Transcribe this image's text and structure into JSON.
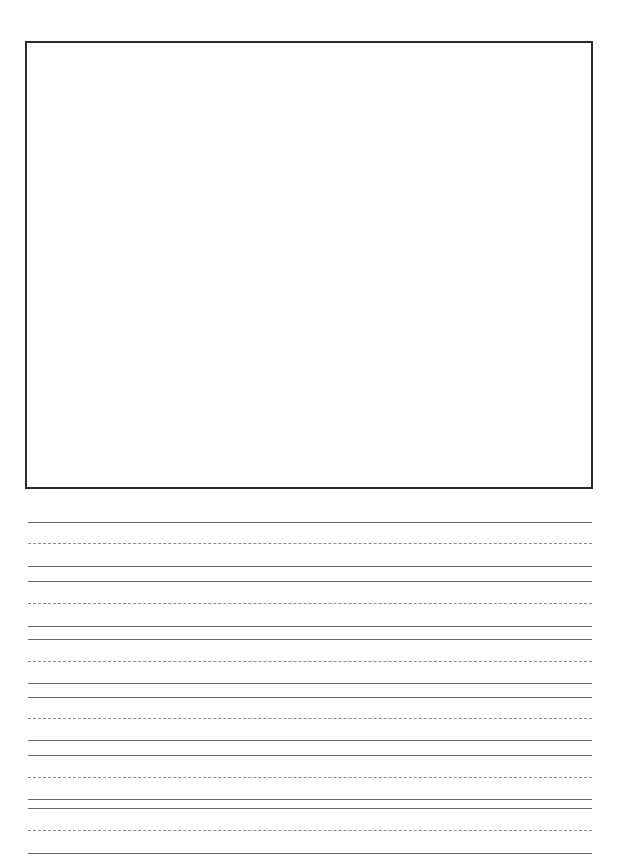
{
  "page": {
    "type": "primary writing paper",
    "drawing_box": {
      "left": 25,
      "top": 41,
      "width": 564,
      "height": 444,
      "border_color": "#2a2a2a"
    },
    "lines": [
      {
        "y": 522,
        "style": "solid"
      },
      {
        "y": 543,
        "style": "dashed"
      },
      {
        "y": 566,
        "style": "solid"
      },
      {
        "y": 581,
        "style": "solid"
      },
      {
        "y": 603,
        "style": "dashed"
      },
      {
        "y": 626,
        "style": "solid"
      },
      {
        "y": 639,
        "style": "solid"
      },
      {
        "y": 661,
        "style": "dashed"
      },
      {
        "y": 683,
        "style": "solid"
      },
      {
        "y": 697,
        "style": "solid"
      },
      {
        "y": 718,
        "style": "dashed"
      },
      {
        "y": 740,
        "style": "solid"
      },
      {
        "y": 755,
        "style": "solid"
      },
      {
        "y": 777,
        "style": "dashed"
      },
      {
        "y": 799,
        "style": "solid"
      },
      {
        "y": 808,
        "style": "solid"
      },
      {
        "y": 830,
        "style": "dashed"
      },
      {
        "y": 853,
        "style": "solid"
      }
    ],
    "colors": {
      "solid_line": "#6a6a6a",
      "dashed_line": "#8a8a8a",
      "background": "#ffffff"
    }
  }
}
